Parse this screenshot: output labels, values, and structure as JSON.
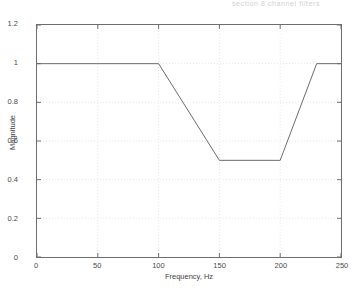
{
  "scan_header": {
    "text": "section 8 channel filters"
  },
  "chart_data": {
    "type": "line",
    "title": "",
    "subtitle": "",
    "xlabel": "Frequency, Hz",
    "ylabel": "Magnitude",
    "xlim": [
      0,
      250
    ],
    "ylim": [
      0,
      1.2
    ],
    "xticks": [
      0,
      50,
      100,
      150,
      200,
      250
    ],
    "xtick_labels": [
      "0",
      "50",
      "100",
      "150",
      "200",
      "250"
    ],
    "yticks": [
      0,
      0.2,
      0.4,
      0.6,
      0.8,
      1,
      1.2
    ],
    "ytick_labels": [
      "0",
      "0.2",
      "0.4",
      "0.6",
      "0.8",
      "1",
      "1.2"
    ],
    "grid": true,
    "grid_style": "dotted",
    "legend": null,
    "legend_position": "none",
    "line_color": "#6b6b6b",
    "axis_color": "#6e6e6e",
    "grid_color": "#e8e8ec",
    "background": "#ffffff",
    "series": [
      {
        "name": "magnitude response",
        "x": [
          0,
          100,
          150,
          200,
          230,
          250
        ],
        "y": [
          1,
          1,
          0.5,
          0.5,
          1,
          1
        ]
      }
    ],
    "annotations": []
  }
}
